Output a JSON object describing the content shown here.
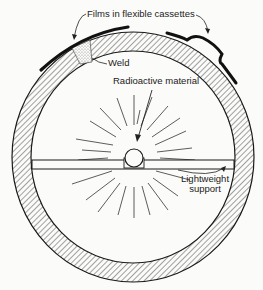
{
  "diagram": {
    "type": "cross-section",
    "labels": {
      "films": "Films in flexible cassettes",
      "weld": "Weld",
      "source": "Radioactive material",
      "support_line1": "Lightweight",
      "support_line2": "support"
    },
    "colors": {
      "ink": "#1a1a1a",
      "background": "#fbfbf9",
      "weld_stipple": "#9a9a9a"
    },
    "geometry": {
      "center": [
        133,
        157
      ],
      "outer_radius_x": 121,
      "outer_radius_y": 125,
      "wall_thickness": 19,
      "support_bar": {
        "x1": 32,
        "x2": 234,
        "y1": 160,
        "y2": 169
      },
      "source_circle": {
        "cx": 134,
        "cy": 158,
        "r": 9
      }
    }
  }
}
